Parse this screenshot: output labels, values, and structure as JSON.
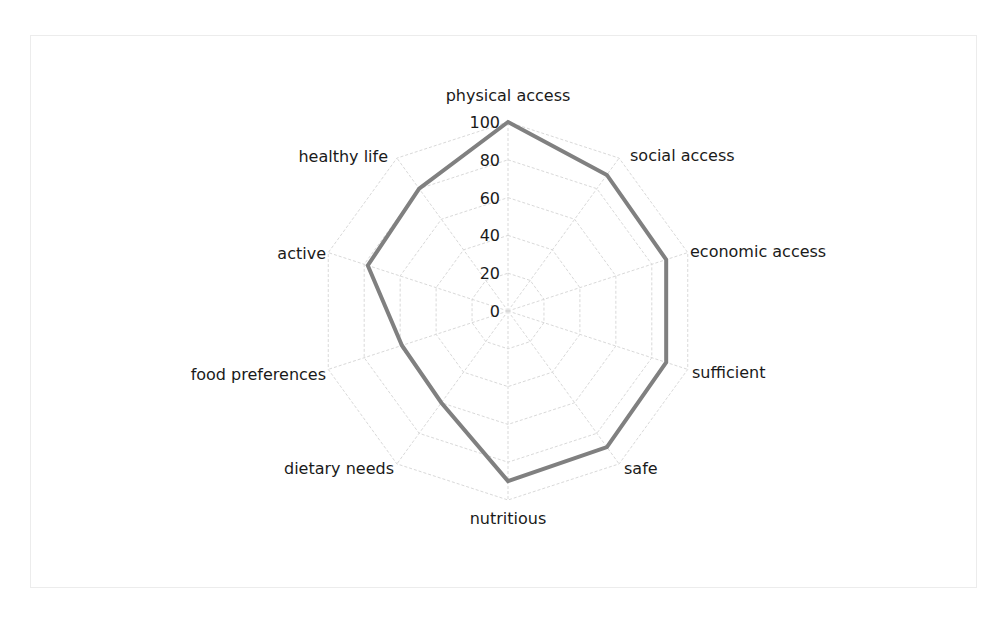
{
  "chart_data": {
    "type": "radar",
    "title": "",
    "categories": [
      "physical access",
      "social access",
      "economic access",
      "sufficient",
      "safe",
      "nutritious",
      "dietary needs",
      "food preferences",
      "active",
      "healthy life"
    ],
    "series": [
      {
        "name": "",
        "values": [
          100,
          89,
          88,
          88,
          89,
          90,
          60,
          59,
          78,
          80
        ],
        "color": "#808080"
      }
    ],
    "r_ticks": [
      "0",
      "20",
      "40",
      "60",
      "80",
      "100"
    ],
    "rlim": [
      0,
      100
    ],
    "grid": true,
    "legend": "none"
  },
  "colors": {
    "series": "#808080",
    "grid": "#d9d9d9",
    "text": "#1a1a1a"
  }
}
